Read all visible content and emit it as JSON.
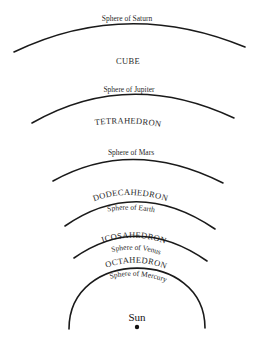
{
  "diagram": {
    "spheres": [
      {
        "name": "saturn",
        "label": "Sphere of Saturn"
      },
      {
        "name": "jupiter",
        "label": "Sphere of Jupiter"
      },
      {
        "name": "mars",
        "label": "Sphere of Mars"
      },
      {
        "name": "earth",
        "label": "Sphere of Earth"
      },
      {
        "name": "venus",
        "label": "Sphere of Venus"
      },
      {
        "name": "mercury",
        "label": "Sphere of Mercury"
      }
    ],
    "solids": [
      {
        "name": "cube",
        "label": "CUBE"
      },
      {
        "name": "tetrahedron",
        "label": "TETRAHEDRON"
      },
      {
        "name": "dodecahedron",
        "label": "DODECAHEDRON"
      },
      {
        "name": "icosahedron",
        "label": "ICOSAHEDRON"
      },
      {
        "name": "octahedron",
        "label": "OCTAHEDRON"
      }
    ],
    "center": {
      "label": "Sun"
    },
    "colors": {
      "line": "#1a1a1a",
      "text": "#2a2a2a",
      "background": "#ffffff"
    }
  }
}
